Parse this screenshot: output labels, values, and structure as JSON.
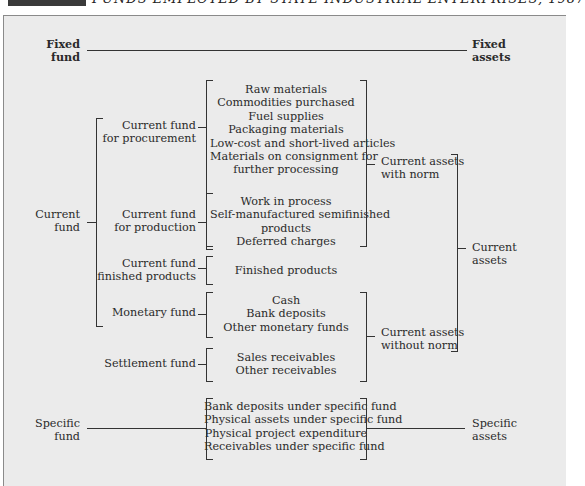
{
  "title": {
    "exhibit_label": "",
    "text": "FUNDS EMPLOYED BY STATE INDUSTRIAL ENTERPRISES, 1987"
  },
  "diagram": {
    "fixed": {
      "fund": [
        "Fixed",
        "fund"
      ],
      "assets": [
        "Fixed",
        "assets"
      ]
    },
    "current_fund": [
      "Current",
      "fund"
    ],
    "sub_funds": {
      "procurement": [
        "Current fund",
        "for procurement"
      ],
      "production": [
        "Current fund",
        "for production"
      ],
      "finished": [
        "Current fund",
        "finished products"
      ],
      "monetary": "Monetary fund",
      "settlement": "Settlement fund"
    },
    "items": {
      "procurement": [
        "Raw materials",
        "Commodities purchased",
        "Fuel supplies",
        "Packaging materials",
        "Low-cost and short-lived articles",
        "Materials on consignment for",
        "further processing"
      ],
      "production": [
        "Work in process",
        "Self-manufactured semifinished",
        "products",
        "Deferred charges"
      ],
      "finished": [
        "Finished products"
      ],
      "monetary": [
        "Cash",
        "Bank deposits",
        "Other monetary funds"
      ],
      "settlement": [
        "Sales receivables",
        "Other receivables"
      ],
      "specific": [
        "Bank deposits under specific fund",
        "Physical assets under specific fund",
        "Physical project expenditure",
        "Receivables under specific fund"
      ]
    },
    "assets_groups": {
      "with_norm": [
        "Current assets",
        "with norm"
      ],
      "without_norm": [
        "Current assets",
        "without norm"
      ],
      "current_assets": [
        "Current",
        "assets"
      ]
    },
    "specific": {
      "fund": [
        "Specific",
        "fund"
      ],
      "assets": [
        "Specific",
        "assets"
      ]
    }
  }
}
